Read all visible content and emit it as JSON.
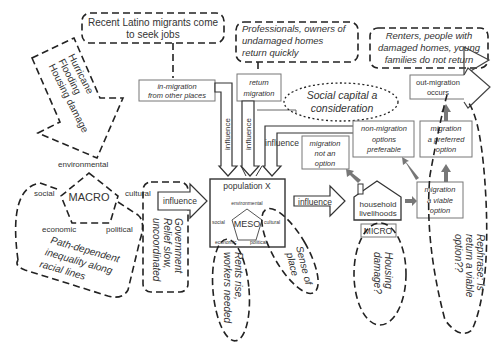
{
  "diagram": {
    "top_notes": {
      "latino": [
        "Recent Latino migrants come",
        "to seek jobs"
      ],
      "professionals": [
        "Professionals, owners of",
        "undamaged homes",
        "return quickly"
      ],
      "renters": [
        "Renters, people with",
        "damaged homes, young",
        "families do not return"
      ]
    },
    "hurricane_arrow": [
      "Hurricane",
      "Flooding",
      "Housing damage"
    ],
    "macro": {
      "label": "MACRO",
      "environmental": "environmental",
      "social": "social",
      "cultural": "cultural",
      "economic": "economic",
      "political": "political"
    },
    "path_dependent": [
      "Path-dependent",
      "inequality along",
      "racial lines"
    ],
    "government": [
      "Government",
      "Relief slow,",
      "uncoordinated"
    ],
    "influence_labels": {
      "macro_to_meso": "influence",
      "in_migration": "influence",
      "return_migration": "influence",
      "not_option": "influence",
      "meso_to_micro": "influence"
    },
    "boxes": {
      "in_migration": [
        "in-migration",
        "from other places"
      ],
      "return_migration": [
        "return",
        "migration"
      ],
      "migration_not_option": [
        "migration",
        "not an",
        "option"
      ],
      "non_migration_preferable": [
        "non-migration",
        "options",
        "preferable"
      ],
      "migration_preferred": [
        "migration",
        "a preferred",
        "option"
      ],
      "migration_viable": [
        "migration",
        "a viable",
        "option"
      ],
      "out_migration": [
        "out-migration",
        "occurs"
      ]
    },
    "social_capital": [
      "Social capital a",
      "consideration"
    ],
    "meso": {
      "title": "population X",
      "label": "MESO",
      "environmental": "environmental",
      "social": "social",
      "cultural": "cultural",
      "economic": "economic",
      "political": "political"
    },
    "rents": [
      "Rents rise,",
      "workers needed"
    ],
    "sense_of_place": [
      "Sense of",
      "place"
    ],
    "household": [
      "household",
      "livelihoods"
    ],
    "micro": "MICRO",
    "housing_damage": [
      "Housing",
      "damage?"
    ],
    "rephrase": [
      "Rephrase: Is",
      "return a viable",
      "option??"
    ]
  }
}
